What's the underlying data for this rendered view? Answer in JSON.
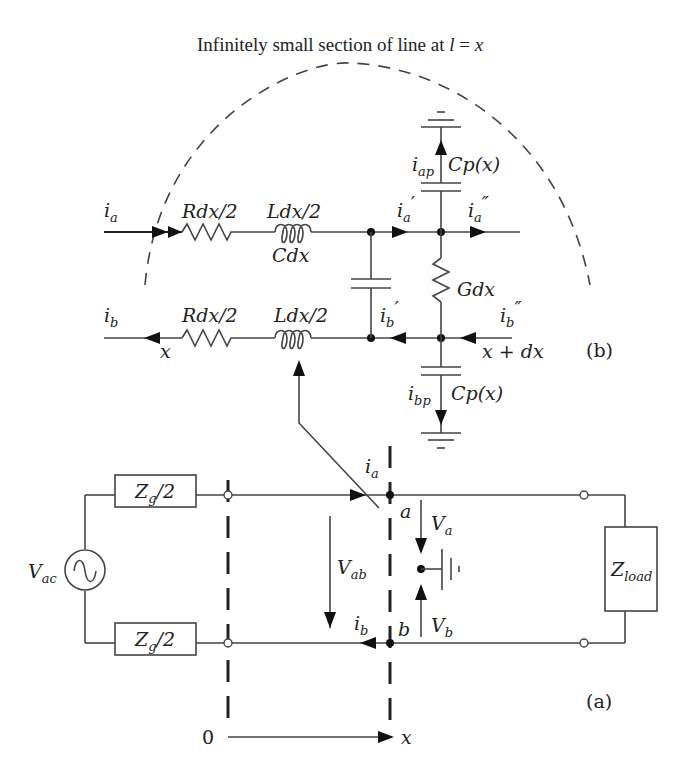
{
  "title": {
    "prefix": "Infinitely small section of line at ",
    "var_l": "l",
    "eq": " = ",
    "var_x": "x"
  },
  "section_b": {
    "label": "(b)",
    "currents": {
      "ia": "i",
      "ia_sub": "a",
      "ia_prime": "i",
      "ia_prime_sub": "a",
      "ia_prime_mark": "′",
      "ia_dprime": "i",
      "ia_dprime_sub": "a",
      "ia_dprime_mark": "″",
      "iap": "i",
      "iap_sub": "ap",
      "ib": "i",
      "ib_sub": "b",
      "ib_prime": "i",
      "ib_prime_sub": "b",
      "ib_prime_mark": "′",
      "ib_dprime": "i",
      "ib_dprime_sub": "b",
      "ib_dprime_mark": "″",
      "ibp": "i",
      "ibp_sub": "bp"
    },
    "components": {
      "r_top": "Rdx/2",
      "l_top": "Ldx/2",
      "c_shunt": "Cdx",
      "r_bottom": "Rdx/2",
      "l_bottom": "Ldx/2",
      "g_shunt": "Gdx",
      "cp_top": "Cp(x)",
      "cp_bottom": "Cp(x)"
    },
    "positions": {
      "left": "x",
      "right": "x + dx"
    }
  },
  "section_a": {
    "label": "(a)",
    "source": "V",
    "source_sub": "ac",
    "zg_top": "Z",
    "zg_top_sub": "g",
    "zg_top_suffix": "/2",
    "zg_bottom": "Z",
    "zg_bottom_sub": "g",
    "zg_bottom_suffix": "/2",
    "load": "Z",
    "load_sub": "load",
    "node_a": "a",
    "node_b": "b",
    "ia": "i",
    "ia_sub": "a",
    "ib": "i",
    "ib_sub": "b",
    "vab": "V",
    "vab_sub": "ab",
    "va": "V",
    "va_sub": "a",
    "vb": "V",
    "vb_sub": "b",
    "axis_origin": "0",
    "axis_x": "x"
  }
}
